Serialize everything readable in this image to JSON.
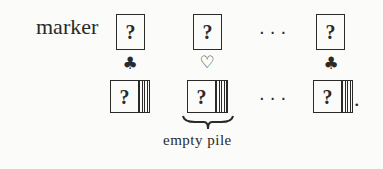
{
  "top_row": {
    "label": "marker",
    "cards": [
      {
        "face": "?",
        "suit": "♣",
        "suit_name": "club"
      },
      {
        "face": "?",
        "suit": "♡",
        "suit_name": "heart-outline"
      },
      {
        "face": "?",
        "suit": "♣",
        "suit_name": "club"
      }
    ],
    "ellipsis": "···"
  },
  "bottom_row": {
    "piles": [
      {
        "face": "?"
      },
      {
        "face": "?"
      },
      {
        "face": "?"
      }
    ],
    "ellipsis": "···",
    "terminal_punct": ".",
    "brace_caption": "empty pile"
  }
}
